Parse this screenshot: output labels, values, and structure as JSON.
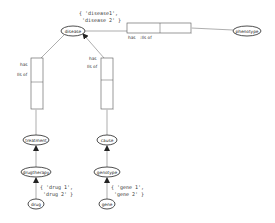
{
  "diagram": {
    "nodes": {
      "disease": {
        "label": "disease"
      },
      "phenotype": {
        "label": "phenotype"
      },
      "treatment": {
        "label": "treatment"
      },
      "cause": {
        "label": "cause"
      },
      "drugtherapy": {
        "label": "drugtherapy"
      },
      "genotype": {
        "label": "genotype"
      },
      "drug": {
        "label": "drug"
      },
      "gene": {
        "label": "gene"
      }
    },
    "relations": {
      "disease_phenotype": {
        "label_line1": "has",
        "label_line2": ":Ils of"
      },
      "treatment_disease": {
        "label_line1": "has",
        "label_line2": "Ils of"
      },
      "cause_disease": {
        "label_line1": "has",
        "label_line2": "Ils of"
      }
    },
    "sets": {
      "disease_set": {
        "line1": "{ 'disease1',",
        "line2": "'disease 2' }"
      },
      "drug_set": {
        "line1": "{ 'drug 1',",
        "line2": "'drug 2' }"
      },
      "gene_set": {
        "line1": "{ 'gene 1',",
        "line2": "'gene 2' }"
      }
    }
  },
  "colors": {
    "stroke": "#333333",
    "line": "#777777",
    "fill": "#ffffff"
  }
}
